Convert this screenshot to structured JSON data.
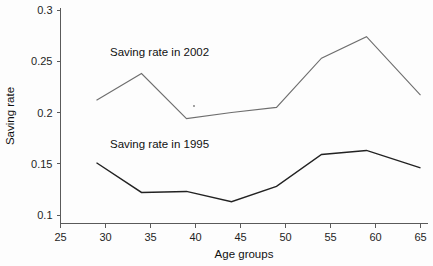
{
  "chart_data": {
    "type": "line",
    "title": "",
    "subtitle": "",
    "xlabel": "Age groups",
    "ylabel": "Saving rate",
    "xlim": [
      25,
      65
    ],
    "ylim": [
      0.1,
      0.3
    ],
    "grid": false,
    "legend_position": "inline-annotation",
    "x": [
      29,
      34,
      39,
      44,
      49,
      54,
      59,
      65
    ],
    "xticks": [
      25,
      30,
      35,
      40,
      45,
      50,
      55,
      60,
      65
    ],
    "xtick_labels": [
      "25",
      "30",
      "35",
      "40",
      "45",
      "50",
      "55",
      "60",
      "65"
    ],
    "yticks": [
      0.1,
      0.15,
      0.2,
      0.25,
      0.3
    ],
    "ytick_labels": [
      "0.1",
      "0.15",
      "0.2",
      "0.25",
      "0.3"
    ],
    "series": [
      {
        "name": "Saving rate in 2002",
        "color": "#6e6e6e",
        "values": [
          0.212,
          0.238,
          0.194,
          0.2,
          0.205,
          0.253,
          0.274,
          0.217
        ]
      },
      {
        "name": "Saving rate in 1995",
        "color": "#222222",
        "values": [
          0.151,
          0.122,
          0.123,
          0.113,
          0.128,
          0.159,
          0.163,
          0.146
        ]
      }
    ],
    "annotations": [
      {
        "text": "Saving rate in 2002",
        "x": 30.5,
        "y": 0.2555
      },
      {
        "text": "Saving rate in 1995",
        "x": 30.5,
        "y": 0.1655
      }
    ]
  },
  "axes": {
    "y_title": "Saving rate",
    "x_title": "Age groups"
  }
}
